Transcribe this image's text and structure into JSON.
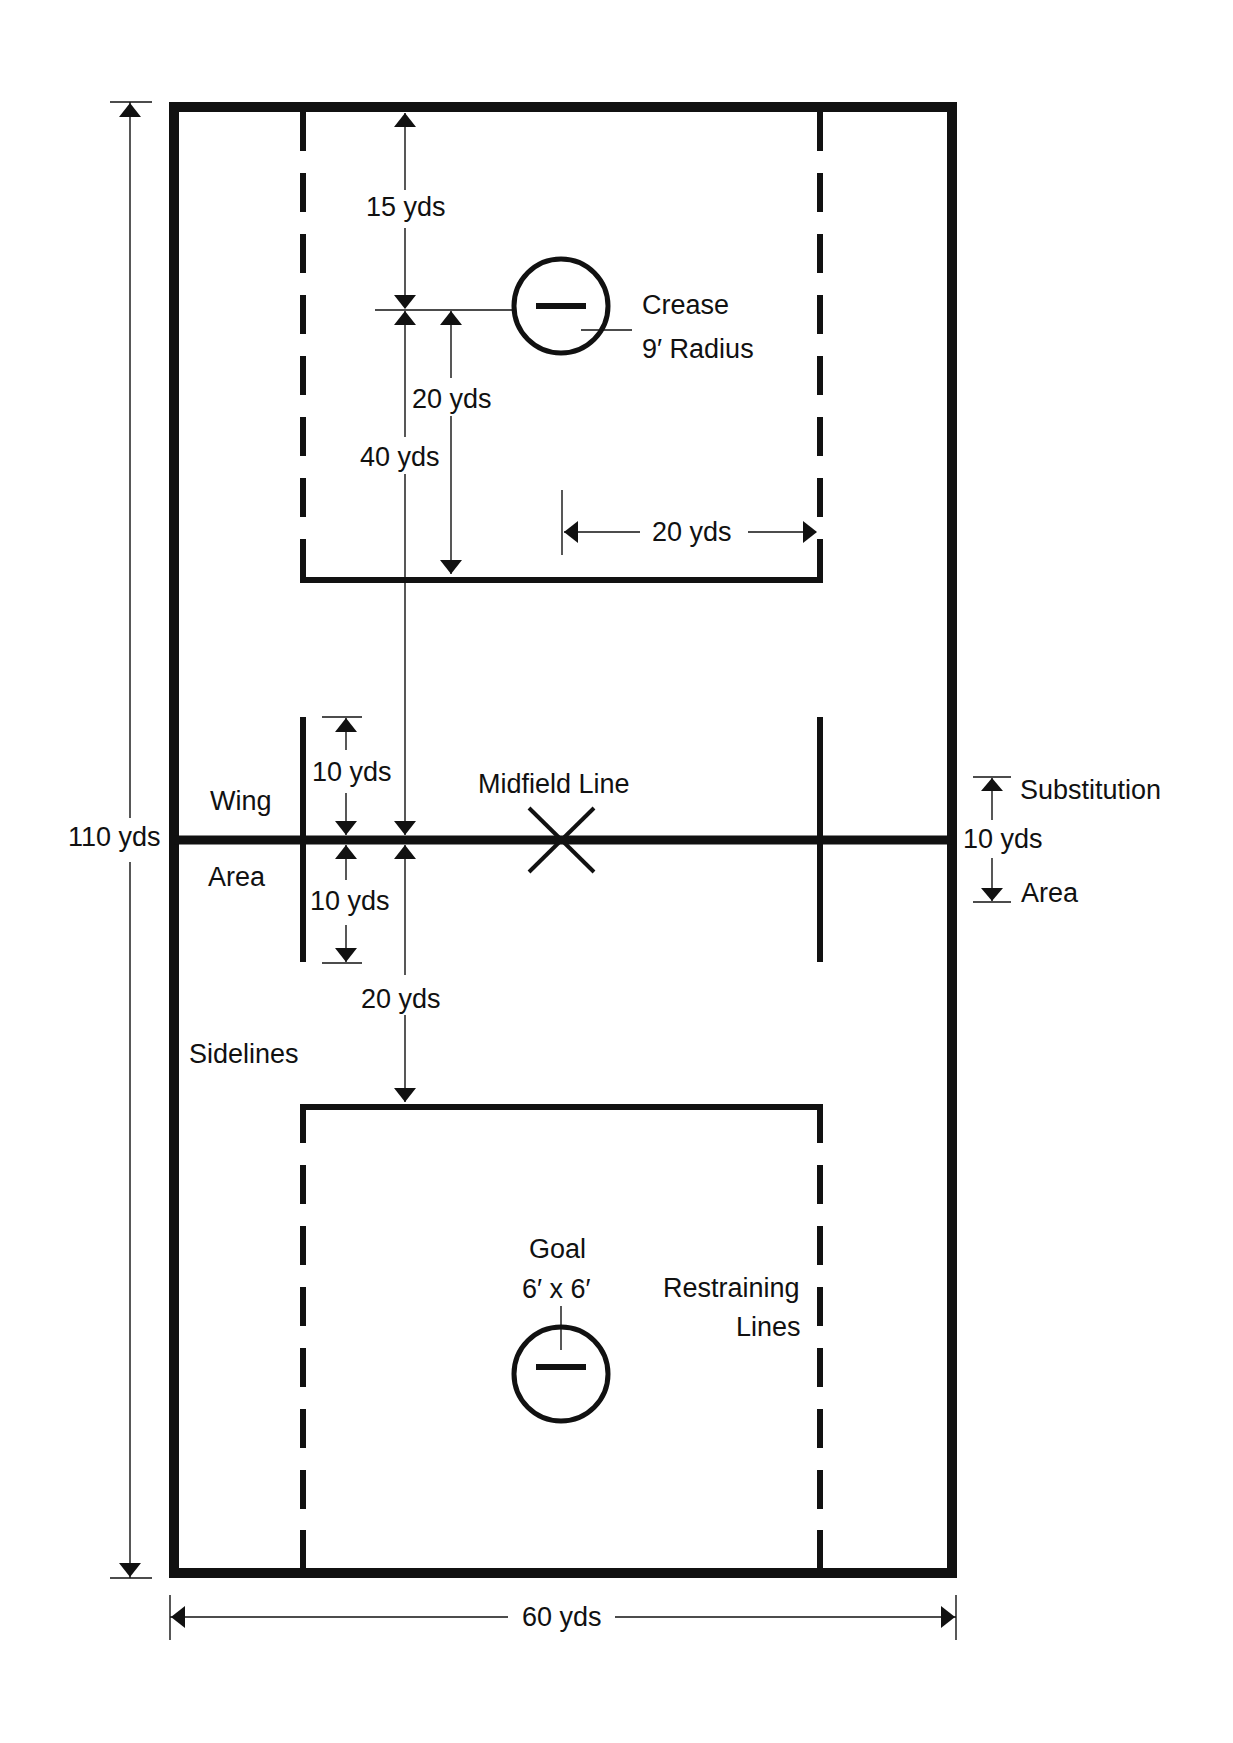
{
  "diagram": {
    "colors": {
      "line": "#111111",
      "background": "#ffffff"
    },
    "dimensions": {
      "length": "110 yds",
      "width": "60 yds"
    },
    "labels": {
      "top_goal_to_endline": "15 yds",
      "goal_to_restraining": "20 yds",
      "goal_to_midfield": "40 yds",
      "restraining_width_offset": "20 yds",
      "crease_title": "Crease",
      "crease_radius": "9′ Radius",
      "wing_area_top": "Wing",
      "wing_area_bottom": "Area",
      "wing_up": "10 yds",
      "wing_down": "10 yds",
      "midfield_line": "Midfield Line",
      "midfield_to_restraining": "20 yds",
      "sidelines": "Sidelines",
      "substitution_title": "Substitution",
      "substitution_length": "10 yds",
      "substitution_area": "Area",
      "goal_title": "Goal",
      "goal_size": "6′ x 6′",
      "restraining_title": "Restraining",
      "restraining_lines": "Lines"
    }
  }
}
